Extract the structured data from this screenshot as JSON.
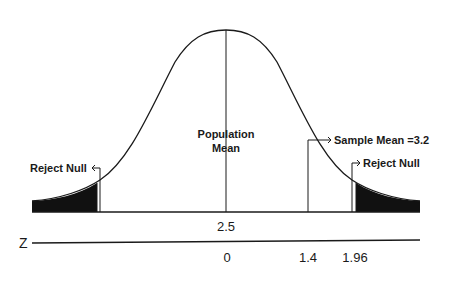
{
  "diagram": {
    "center_label": {
      "line1": "Population",
      "line2": "Mean"
    },
    "sample_mean_label": "Sample Mean =3.2",
    "reject_left_label": "Reject Null",
    "reject_right_label": "Reject Null",
    "value_above_axis": "2.5",
    "axis": {
      "name": "Z",
      "ticks": [
        "0",
        "1.4",
        "1.96"
      ]
    },
    "colors": {
      "curve": "#1a1a1a",
      "shaded_tail": "#111111",
      "background": "#ffffff"
    }
  }
}
